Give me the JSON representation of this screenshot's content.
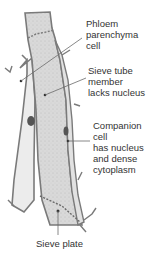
{
  "diagram": {
    "labels": {
      "phloem_parenchyma": "Phloem\nparenchyma\ncell",
      "sieve_tube": "Sieve tube\nmember\nlacks nucleus",
      "companion_cell": "Companion cell\nhas nucleus\nand dense\ncytoplasm",
      "sieve_plate": "Sieve plate"
    },
    "colors": {
      "cell_wall": "#7a7a7a",
      "sieve_fill": "#d8d8d8",
      "parenchyma_fill": "#ececec",
      "companion_fill": "#e2e2e2",
      "nucleus": "#555555",
      "leader_line": "#6a6a6a",
      "text": "#333333"
    }
  }
}
